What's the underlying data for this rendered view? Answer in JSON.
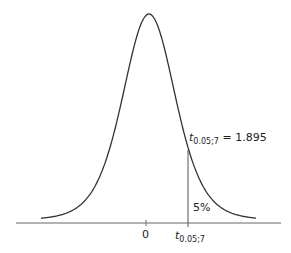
{
  "chart_data": {
    "type": "line",
    "title": "",
    "xlabel": "",
    "ylabel": "",
    "grid": false,
    "legend": null,
    "x_ticks": [
      {
        "value": 0,
        "label": "0"
      },
      {
        "value": 1.895,
        "label": "t_{0.05;7}"
      }
    ],
    "distribution": {
      "name": "t",
      "df": 7
    },
    "critical_value": {
      "symbol": "t",
      "subscript": "0.05;7",
      "value": 1.895,
      "label": "t_{0.05;7} = 1.895"
    },
    "shaded_tail": {
      "side": "right",
      "area_percent": 5,
      "label": "5%"
    },
    "x_range": [
      -3.5,
      4.3
    ]
  },
  "labels": {
    "zero_tick": "0",
    "crit_tick_main": "t",
    "crit_tick_sub": "0.05;7",
    "crit_annot_main": "t",
    "crit_annot_sub": "0.05;7",
    "crit_annot_value": " = 1.895",
    "tail_area": "5%"
  },
  "colors": {
    "curve": "#333333",
    "axis": "#666666",
    "text": "#222222"
  }
}
